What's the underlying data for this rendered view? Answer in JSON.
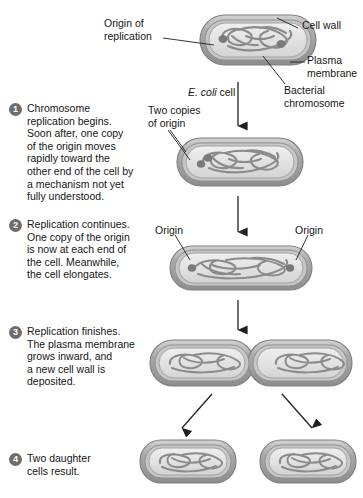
{
  "figure": {
    "organism_label_italic": "E. coli",
    "organism_label_rest": " cell"
  },
  "colors": {
    "cell_wall_outer": "#8e8e8e",
    "cell_wall_fill": "#b9b9b9",
    "plasma_membrane": "#9a9a9a",
    "cytoplasm": "#dcdcdc",
    "cytoplasm_light": "#ededed",
    "chromosome": "#8a8a8a",
    "chromosome_dark": "#6f6f6f",
    "bullet": "#6d6d6d",
    "text": "#161616",
    "leader_line": "#2b2b2b",
    "background": "#ffffff"
  },
  "callouts": [
    {
      "id": "origin-of-replication",
      "text": "Origin of\nreplication"
    },
    {
      "id": "cell-wall",
      "text": "Cell wall"
    },
    {
      "id": "plasma-membrane",
      "text": "Plasma\nmembrane"
    },
    {
      "id": "bacterial-chromosome",
      "text": "Bacterial\nchromosome"
    },
    {
      "id": "two-copies-of-origin",
      "text": "Two copies\nof origin"
    },
    {
      "id": "origin-left",
      "text": "Origin"
    },
    {
      "id": "origin-right",
      "text": "Origin"
    }
  ],
  "steps": [
    {
      "number": "1",
      "text": "Chromosome\nreplication begins.\nSoon after, one copy\nof the origin moves\nrapidly toward the\nother end of the cell by\na mechanism not yet\nfully understood."
    },
    {
      "number": "2",
      "text": "Replication continues.\nOne copy of the origin\nis now at each end of\nthe cell. Meanwhile,\nthe cell elongates."
    },
    {
      "number": "3",
      "text": "Replication finishes.\nThe plasma membrane\ngrows inward, and\na new cell wall is\ndeposited."
    },
    {
      "number": "4",
      "text": "Two daughter\ncells result."
    }
  ],
  "stages": [
    {
      "id": "stage-parent-cell",
      "caption": "E. coli cell"
    },
    {
      "id": "stage-1-cell",
      "caption": ""
    },
    {
      "id": "stage-2-cell",
      "caption": ""
    },
    {
      "id": "stage-3-dividing-cell",
      "caption": ""
    },
    {
      "id": "stage-4-daughter-cell-left",
      "caption": ""
    },
    {
      "id": "stage-4-daughter-cell-right",
      "caption": ""
    }
  ]
}
